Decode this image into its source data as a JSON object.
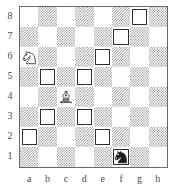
{
  "diagram": {
    "type": "chess-board-diagram",
    "orientation": "white-bottom",
    "board_size": 8,
    "file_labels": [
      "a",
      "b",
      "c",
      "d",
      "e",
      "f",
      "g",
      "h"
    ],
    "rank_labels": [
      "8",
      "7",
      "6",
      "5",
      "4",
      "3",
      "2",
      "1"
    ],
    "colors": {
      "light_square": "#ffffff",
      "dark_square": "#9a9a9a",
      "border": "#6b6b6b",
      "marker_border": "#2f2f2f",
      "label_text": "#4a4a4a"
    },
    "pieces": [
      {
        "square": "a6",
        "color": "white",
        "type": "knight",
        "icon": "white-knight-icon"
      },
      {
        "square": "c4",
        "color": "white",
        "type": "bishop",
        "icon": "white-bishop-icon"
      },
      {
        "square": "f1",
        "color": "black",
        "type": "knight",
        "icon": "black-knight-icon"
      }
    ],
    "marked_squares": [
      "g8",
      "f7",
      "e6",
      "b5",
      "d5",
      "b3",
      "d3",
      "a2",
      "e2",
      "f1"
    ],
    "squares": [
      {
        "id": "a8",
        "shade": "light",
        "marked": false,
        "piece": null
      },
      {
        "id": "b8",
        "shade": "dark",
        "marked": false,
        "piece": null
      },
      {
        "id": "c8",
        "shade": "light",
        "marked": false,
        "piece": null
      },
      {
        "id": "d8",
        "shade": "dark",
        "marked": false,
        "piece": null
      },
      {
        "id": "e8",
        "shade": "light",
        "marked": false,
        "piece": null
      },
      {
        "id": "f8",
        "shade": "dark",
        "marked": false,
        "piece": null
      },
      {
        "id": "g8",
        "shade": "light",
        "marked": true,
        "piece": null
      },
      {
        "id": "h8",
        "shade": "dark",
        "marked": false,
        "piece": null
      },
      {
        "id": "a7",
        "shade": "dark",
        "marked": false,
        "piece": null
      },
      {
        "id": "b7",
        "shade": "light",
        "marked": false,
        "piece": null
      },
      {
        "id": "c7",
        "shade": "dark",
        "marked": false,
        "piece": null
      },
      {
        "id": "d7",
        "shade": "light",
        "marked": false,
        "piece": null
      },
      {
        "id": "e7",
        "shade": "dark",
        "marked": false,
        "piece": null
      },
      {
        "id": "f7",
        "shade": "light",
        "marked": true,
        "piece": null
      },
      {
        "id": "g7",
        "shade": "dark",
        "marked": false,
        "piece": null
      },
      {
        "id": "h7",
        "shade": "light",
        "marked": false,
        "piece": null
      },
      {
        "id": "a6",
        "shade": "light",
        "marked": false,
        "piece": "white-knight"
      },
      {
        "id": "b6",
        "shade": "dark",
        "marked": false,
        "piece": null
      },
      {
        "id": "c6",
        "shade": "light",
        "marked": false,
        "piece": null
      },
      {
        "id": "d6",
        "shade": "dark",
        "marked": false,
        "piece": null
      },
      {
        "id": "e6",
        "shade": "light",
        "marked": true,
        "piece": null
      },
      {
        "id": "f6",
        "shade": "dark",
        "marked": false,
        "piece": null
      },
      {
        "id": "g6",
        "shade": "light",
        "marked": false,
        "piece": null
      },
      {
        "id": "h6",
        "shade": "dark",
        "marked": false,
        "piece": null
      },
      {
        "id": "a5",
        "shade": "dark",
        "marked": false,
        "piece": null
      },
      {
        "id": "b5",
        "shade": "light",
        "marked": true,
        "piece": null
      },
      {
        "id": "c5",
        "shade": "dark",
        "marked": false,
        "piece": null
      },
      {
        "id": "d5",
        "shade": "light",
        "marked": true,
        "piece": null
      },
      {
        "id": "e5",
        "shade": "dark",
        "marked": false,
        "piece": null
      },
      {
        "id": "f5",
        "shade": "light",
        "marked": false,
        "piece": null
      },
      {
        "id": "g5",
        "shade": "dark",
        "marked": false,
        "piece": null
      },
      {
        "id": "h5",
        "shade": "light",
        "marked": false,
        "piece": null
      },
      {
        "id": "a4",
        "shade": "light",
        "marked": false,
        "piece": null
      },
      {
        "id": "b4",
        "shade": "dark",
        "marked": false,
        "piece": null
      },
      {
        "id": "c4",
        "shade": "light",
        "marked": false,
        "piece": "white-bishop"
      },
      {
        "id": "d4",
        "shade": "dark",
        "marked": false,
        "piece": null
      },
      {
        "id": "e4",
        "shade": "light",
        "marked": false,
        "piece": null
      },
      {
        "id": "f4",
        "shade": "dark",
        "marked": false,
        "piece": null
      },
      {
        "id": "g4",
        "shade": "light",
        "marked": false,
        "piece": null
      },
      {
        "id": "h4",
        "shade": "dark",
        "marked": false,
        "piece": null
      },
      {
        "id": "a3",
        "shade": "dark",
        "marked": false,
        "piece": null
      },
      {
        "id": "b3",
        "shade": "light",
        "marked": true,
        "piece": null
      },
      {
        "id": "c3",
        "shade": "dark",
        "marked": false,
        "piece": null
      },
      {
        "id": "d3",
        "shade": "light",
        "marked": true,
        "piece": null
      },
      {
        "id": "e3",
        "shade": "dark",
        "marked": false,
        "piece": null
      },
      {
        "id": "f3",
        "shade": "light",
        "marked": false,
        "piece": null
      },
      {
        "id": "g3",
        "shade": "dark",
        "marked": false,
        "piece": null
      },
      {
        "id": "h3",
        "shade": "light",
        "marked": false,
        "piece": null
      },
      {
        "id": "a2",
        "shade": "light",
        "marked": true,
        "piece": null
      },
      {
        "id": "b2",
        "shade": "dark",
        "marked": false,
        "piece": null
      },
      {
        "id": "c2",
        "shade": "light",
        "marked": false,
        "piece": null
      },
      {
        "id": "d2",
        "shade": "dark",
        "marked": false,
        "piece": null
      },
      {
        "id": "e2",
        "shade": "light",
        "marked": true,
        "piece": null
      },
      {
        "id": "f2",
        "shade": "dark",
        "marked": false,
        "piece": null
      },
      {
        "id": "g2",
        "shade": "light",
        "marked": false,
        "piece": null
      },
      {
        "id": "h2",
        "shade": "dark",
        "marked": false,
        "piece": null
      },
      {
        "id": "a1",
        "shade": "dark",
        "marked": false,
        "piece": null
      },
      {
        "id": "b1",
        "shade": "light",
        "marked": false,
        "piece": null
      },
      {
        "id": "c1",
        "shade": "dark",
        "marked": false,
        "piece": null
      },
      {
        "id": "d1",
        "shade": "light",
        "marked": false,
        "piece": null
      },
      {
        "id": "e1",
        "shade": "dark",
        "marked": false,
        "piece": null
      },
      {
        "id": "f1",
        "shade": "light",
        "marked": true,
        "piece": "black-knight"
      },
      {
        "id": "g1",
        "shade": "dark",
        "marked": false,
        "piece": null
      },
      {
        "id": "h1",
        "shade": "light",
        "marked": false,
        "piece": null
      }
    ]
  }
}
